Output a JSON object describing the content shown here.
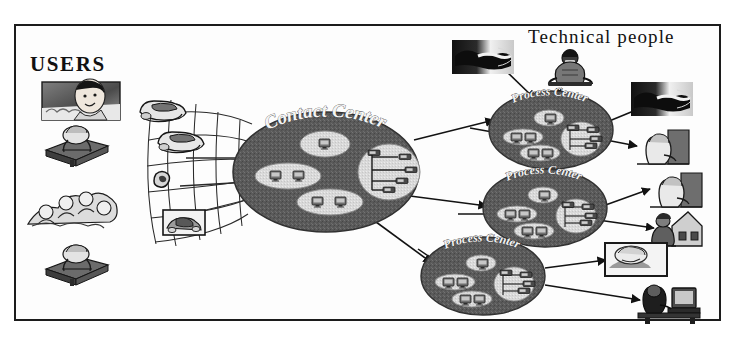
{
  "diagram": {
    "background_color": "#ffffff",
    "frame_color": "#1c1c1c",
    "node_fill_color": "#5a5a5a",
    "node_inner_fill_color": "#d8d8d8",
    "text_color": "#111111",
    "node_label_color": "#f4f4f4",
    "connector_color": "#121212"
  },
  "labels": {
    "users": "USERS",
    "technical_people": "Technical people"
  },
  "nodes": [
    {
      "id": "contact-center",
      "label": "Contact Center",
      "cx": 326,
      "cy": 172,
      "rx": 93,
      "ry": 60,
      "label_arc": "top",
      "inner_pods": [
        {
          "id": "pod-top",
          "cx": 325,
          "cy": 144,
          "rx": 25,
          "ry": 13,
          "icons": [
            "monitor-icon"
          ]
        },
        {
          "id": "pod-left",
          "cx": 288,
          "cy": 176,
          "rx": 33,
          "ry": 13,
          "icons": [
            "monitor-icon",
            "monitor-icon"
          ]
        },
        {
          "id": "pod-bottom",
          "cx": 330,
          "cy": 202,
          "rx": 33,
          "ry": 13,
          "icons": [
            "monitor-icon",
            "monitor-icon"
          ]
        },
        {
          "id": "pod-network",
          "cx": 389,
          "cy": 172,
          "rx": 31,
          "ry": 28,
          "icons": [
            "network-tree-icon"
          ]
        }
      ]
    },
    {
      "id": "process-center-1",
      "label": "Process Center",
      "cx": 551,
      "cy": 130,
      "rx": 62,
      "ry": 39,
      "label_arc": "top",
      "inner_pods": [
        {
          "id": "pod-top",
          "cx": 549,
          "cy": 118,
          "rx": 15,
          "ry": 8,
          "icons": [
            "monitor-icon"
          ]
        },
        {
          "id": "pod-left",
          "cx": 523,
          "cy": 137,
          "rx": 20,
          "ry": 8,
          "icons": [
            "monitor-icon",
            "monitor-icon"
          ]
        },
        {
          "id": "pod-bottom",
          "cx": 540,
          "cy": 153,
          "rx": 20,
          "ry": 8,
          "icons": [
            "monitor-icon",
            "monitor-icon"
          ]
        },
        {
          "id": "pod-network",
          "cx": 581,
          "cy": 139,
          "rx": 20,
          "ry": 17,
          "icons": [
            "network-tree-icon"
          ]
        }
      ]
    },
    {
      "id": "process-center-2",
      "label": "Process Center",
      "cx": 545,
      "cy": 208,
      "rx": 62,
      "ry": 39,
      "label_arc": "top",
      "inner_pods": [
        {
          "id": "pod-top",
          "cx": 543,
          "cy": 195,
          "rx": 15,
          "ry": 8,
          "icons": [
            "monitor-icon"
          ]
        },
        {
          "id": "pod-left",
          "cx": 517,
          "cy": 214,
          "rx": 20,
          "ry": 8,
          "icons": [
            "monitor-icon",
            "monitor-icon"
          ]
        },
        {
          "id": "pod-bottom",
          "cx": 534,
          "cy": 231,
          "rx": 20,
          "ry": 8,
          "icons": [
            "monitor-icon",
            "monitor-icon"
          ]
        },
        {
          "id": "pod-network",
          "cx": 576,
          "cy": 216,
          "rx": 20,
          "ry": 17,
          "icons": [
            "network-tree-icon"
          ]
        }
      ]
    },
    {
      "id": "process-center-3",
      "label": "Process Center",
      "cx": 483,
      "cy": 276,
      "rx": 62,
      "ry": 39,
      "label_arc": "top",
      "inner_pods": [
        {
          "id": "pod-top",
          "cx": 481,
          "cy": 263,
          "rx": 15,
          "ry": 8,
          "icons": [
            "monitor-icon"
          ]
        },
        {
          "id": "pod-left",
          "cx": 455,
          "cy": 282,
          "rx": 20,
          "ry": 8,
          "icons": [
            "monitor-icon",
            "monitor-icon"
          ]
        },
        {
          "id": "pod-bottom",
          "cx": 472,
          "cy": 299,
          "rx": 20,
          "ry": 8,
          "icons": [
            "monitor-icon",
            "monitor-icon"
          ]
        },
        {
          "id": "pod-network",
          "cx": 514,
          "cy": 284,
          "rx": 20,
          "ry": 17,
          "icons": [
            "network-tree-icon"
          ]
        }
      ]
    }
  ],
  "user_images": [
    {
      "id": "user-photo-man",
      "icon": "man-portrait-photo",
      "x": 42,
      "y": 82,
      "w": 78,
      "h": 38
    },
    {
      "id": "user-person-desk-1",
      "icon": "person-at-desk-icon",
      "x": 46,
      "y": 128,
      "w": 62,
      "h": 34
    },
    {
      "id": "user-crowd",
      "icon": "crowd-of-people-icon",
      "x": 28,
      "y": 188,
      "w": 88,
      "h": 40
    },
    {
      "id": "user-person-desk-2",
      "icon": "person-at-desk-icon",
      "x": 46,
      "y": 247,
      "w": 62,
      "h": 34
    }
  ],
  "technical_images": [
    {
      "id": "tech-handshake-top",
      "icon": "handshake-photo",
      "x": 452,
      "y": 40,
      "w": 62,
      "h": 34
    },
    {
      "id": "tech-operator",
      "icon": "uniformed-operator-icon",
      "x": 549,
      "y": 50,
      "w": 42,
      "h": 38
    },
    {
      "id": "tech-handshake-right",
      "icon": "handshake-photo",
      "x": 631,
      "y": 82,
      "w": 62,
      "h": 34
    },
    {
      "id": "tech-agent-1",
      "icon": "person-at-computer-icon",
      "x": 637,
      "y": 130,
      "w": 52,
      "h": 34
    },
    {
      "id": "tech-agent-2",
      "icon": "person-at-computer-icon",
      "x": 650,
      "y": 173,
      "w": 52,
      "h": 34
    },
    {
      "id": "tech-home-office",
      "icon": "person-home-office-icon",
      "x": 652,
      "y": 212,
      "w": 48,
      "h": 34
    },
    {
      "id": "tech-framed-person",
      "icon": "framed-person-photo",
      "x": 605,
      "y": 243,
      "w": 62,
      "h": 33
    },
    {
      "id": "tech-workstation",
      "icon": "person-at-workstation-icon",
      "x": 638,
      "y": 286,
      "w": 62,
      "h": 36
    }
  ],
  "user_network": {
    "id": "user-access-mesh",
    "description": "Grid mesh of user access lines fanning toward the Contact Center",
    "devices": [
      {
        "id": "terminal-top",
        "icon": "computer-terminal-icon",
        "x": 140,
        "y": 102,
        "w": 50,
        "h": 26
      },
      {
        "id": "terminal-mid",
        "icon": "computer-terminal-icon",
        "x": 158,
        "y": 133,
        "w": 50,
        "h": 26
      },
      {
        "id": "telephone",
        "icon": "telephone-handset-icon",
        "x": 155,
        "y": 172,
        "w": 18,
        "h": 18
      },
      {
        "id": "boxed-device",
        "icon": "fax-device-icon",
        "x": 163,
        "y": 210,
        "w": 40,
        "h": 24
      }
    ]
  },
  "connectors": [
    {
      "id": "contact-to-pc1",
      "from": "contact-center",
      "to": "process-center-1"
    },
    {
      "id": "contact-to-pc2",
      "from": "contact-center",
      "to": "process-center-2"
    },
    {
      "id": "contact-to-pc3",
      "from": "contact-center",
      "to": "process-center-3"
    },
    {
      "id": "handshake-to-pc1",
      "from": "tech-handshake-top",
      "to": "process-center-1"
    },
    {
      "id": "operator-to-pc1",
      "from": "tech-operator",
      "to": "process-center-1"
    },
    {
      "id": "handshake-right-to-pc1",
      "from": "tech-handshake-right",
      "to": "process-center-1"
    },
    {
      "id": "pc1-to-agent1",
      "from": "process-center-1",
      "to": "tech-agent-1"
    },
    {
      "id": "pc2-to-agent2",
      "from": "process-center-2",
      "to": "tech-agent-2"
    },
    {
      "id": "pc2-to-home",
      "from": "process-center-2",
      "to": "tech-home-office"
    },
    {
      "id": "pc3-to-framed",
      "from": "process-center-3",
      "to": "tech-framed-person"
    },
    {
      "id": "pc3-to-workstation",
      "from": "process-center-3",
      "to": "tech-workstation"
    }
  ]
}
